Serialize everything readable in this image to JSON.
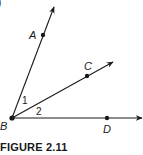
{
  "figure": {
    "caption": "FIGURE 2.11",
    "corner_fragment": ")",
    "colors": {
      "stroke": "#1a1a1a",
      "background": "#ffffff"
    },
    "vertex": {
      "label": "B",
      "x": 12,
      "y": 118
    },
    "rays": [
      {
        "name": "BA",
        "point_label": "A",
        "point": [
          43,
          35
        ],
        "tip": [
          54,
          7
        ]
      },
      {
        "name": "BC",
        "point_label": "C",
        "point": [
          87,
          76
        ],
        "tip": [
          113,
          62
        ]
      },
      {
        "name": "BD",
        "point_label": "D",
        "point": [
          107,
          118
        ],
        "tip": [
          142,
          118
        ]
      }
    ],
    "angles": [
      {
        "label": "1",
        "between": [
          "BA",
          "BC"
        ]
      },
      {
        "label": "2",
        "between": [
          "BC",
          "BD"
        ]
      }
    ]
  }
}
